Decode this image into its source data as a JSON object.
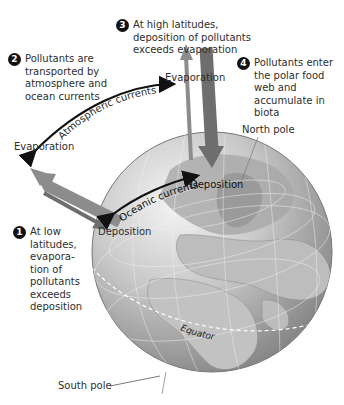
{
  "diagram": {
    "steps": [
      {
        "number": "1",
        "text": "At low\nlatitudes,\nevapora-\ntion of\npollutants\nexceeds\ndeposition"
      },
      {
        "number": "2",
        "text": "Pollutants are\ntransported by\natmosphere and\nocean currents"
      },
      {
        "number": "3",
        "text": "At high latitudes,\ndeposition of pollutants\nexceeds evaporation"
      },
      {
        "number": "4",
        "text": "Pollutants enter\nthe polar food\nweb and\naccumulate in\nbiota"
      }
    ],
    "labels": {
      "evaporation_low": "Evaporation",
      "evaporation_high": "Evaporation",
      "deposition_low": "Deposition",
      "deposition_high": "Deposition",
      "atmospheric_currents": "Atmospheric currents",
      "oceanic_currents": "Oceanic currents",
      "north_pole": "North pole",
      "south_pole": "South pole",
      "equator": "Equator"
    },
    "colors": {
      "globe_ocean": "#9a9a9a",
      "globe_land": "#c8c8c8",
      "arrow_evaporation": "#8c8c8c",
      "arrow_deposition": "#6e6e6e",
      "current_arrow": "#111111",
      "text": "#2e2e2e"
    }
  }
}
